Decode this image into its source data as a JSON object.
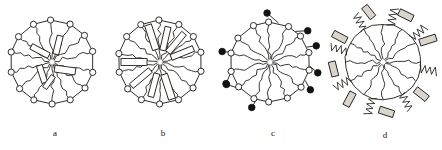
{
  "figure": {
    "background_color": "#ffffff",
    "ink_color": "#1a1713",
    "fill_color": "#141210",
    "rod_fill": "#ffffff",
    "rod_shaded_fill": "#d9d5cd",
    "width": 442,
    "height": 150
  },
  "panels": [
    {
      "id": "a",
      "caption": "a",
      "center": {
        "x": 52,
        "y": 62
      },
      "radius": 42,
      "description": "core with wavy radial chains, open beads on perimeter ring, randomly oriented rods inside",
      "bead_count": 14,
      "bead_type": "open",
      "bead_radius": 3.1,
      "chain_count": 14,
      "chain_style": "wavy",
      "rod_count": 5,
      "rod_placement": "interior-disordered",
      "rods": [
        {
          "cx": -12,
          "cy": -11,
          "angle": 28,
          "w": 20,
          "h": 6
        },
        {
          "cx": 6,
          "cy": -17,
          "angle": 104,
          "w": 19,
          "h": 6
        },
        {
          "cx": -10,
          "cy": 12,
          "angle": 72,
          "w": 18,
          "h": 6
        },
        {
          "cx": 13,
          "cy": 8,
          "angle": 8,
          "w": 21,
          "h": 7
        },
        {
          "cx": -3,
          "cy": 20,
          "angle": 126,
          "w": 15,
          "h": 5
        }
      ]
    },
    {
      "id": "b",
      "caption": "b",
      "center": {
        "x": 160,
        "y": 62
      },
      "radius": 42,
      "description": "core with wavy radial chains, open beads on perimeter ring, rods aligned radially from the centre",
      "bead_count": 14,
      "bead_type": "open",
      "bead_radius": 3.1,
      "chain_count": 14,
      "chain_style": "wavy",
      "rod_count": 8,
      "rod_placement": "radial-ordered",
      "rods": [
        {
          "angle": 252,
          "r": 26,
          "w": 26,
          "h": 7
        },
        {
          "angle": 283,
          "r": 24,
          "w": 24,
          "h": 6
        },
        {
          "angle": 310,
          "r": 25,
          "w": 25,
          "h": 6
        },
        {
          "angle": 338,
          "r": 24,
          "w": 24,
          "h": 6
        },
        {
          "angle": 72,
          "r": 26,
          "w": 26,
          "h": 7
        },
        {
          "angle": 105,
          "r": 24,
          "w": 24,
          "h": 6
        },
        {
          "angle": 140,
          "r": 25,
          "w": 25,
          "h": 6
        },
        {
          "angle": 180,
          "r": 26,
          "w": 26,
          "h": 7
        }
      ]
    },
    {
      "id": "c",
      "caption": "c",
      "center": {
        "x": 270,
        "y": 62
      },
      "radius": 40,
      "description": "core with wavy radial chains, open beads on the ring each linked by a short stalk to a filled bead outside",
      "bead_count": 14,
      "bead_type": "open-with-filled-satellite",
      "bead_radius": 3.1,
      "filled_bead_radius": 3.3,
      "filled_bead_count": 9,
      "stalk_length": 9,
      "chain_count": 14,
      "chain_style": "wavy",
      "rod_count": 0,
      "satellite_angles": [
        118,
        96,
        68,
        40,
        12,
        200,
        228,
        256,
        284
      ]
    },
    {
      "id": "d",
      "caption": "d",
      "center": {
        "x": 383,
        "y": 62
      },
      "radius": 38,
      "description": "core with wavy radial chains, no perimeter beads, shaded rods and zig-zag coil chains radiating outward",
      "bead_count": 0,
      "chain_count": 12,
      "chain_style": "wavy",
      "rod_count": 8,
      "rod_placement": "exterior-tangential",
      "zigzag_count": 8,
      "rods": [
        {
          "angle": 130,
          "r": 50,
          "tilt": 38,
          "w": 15,
          "h": 7
        },
        {
          "angle": 64,
          "r": 50,
          "tilt": -18,
          "w": 17,
          "h": 7
        },
        {
          "angle": 26,
          "r": 52,
          "tilt": 26,
          "w": 15,
          "h": 7
        },
        {
          "angle": 344,
          "r": 52,
          "tilt": 52,
          "w": 14,
          "h": 7
        },
        {
          "angle": 300,
          "r": 50,
          "tilt": 28,
          "w": 15,
          "h": 7
        },
        {
          "angle": 262,
          "r": 50,
          "tilt": 76,
          "w": 15,
          "h": 7
        },
        {
          "angle": 222,
          "r": 50,
          "tilt": 118,
          "w": 15,
          "h": 7
        },
        {
          "angle": 176,
          "r": 50,
          "tilt": 18,
          "w": 15,
          "h": 7
        }
      ],
      "zigzag_angles": [
        100,
        150,
        196,
        242,
        286,
        330,
        12,
        50
      ]
    }
  ]
}
